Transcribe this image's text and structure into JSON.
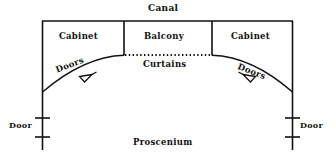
{
  "diagram": {
    "background_color": "#ffffff",
    "line_color": "#111111",
    "labels": {
      "canal": "Canal",
      "cabinet_left": "Cabinet",
      "balcony": "Balcony",
      "cabinet_right": "Cabinet",
      "curtains": "Curtains",
      "doors_left": "Doors",
      "doors_right": "Doors",
      "door_left": "Door",
      "door_right": "Door",
      "proscenium": "Proscenium"
    },
    "icons": {
      "arrow_left": "arrow-wedge-icon",
      "arrow_right": "arrow-wedge-icon",
      "door_swing_left": "door-jamb-icon",
      "door_swing_right": "door-jamb-icon"
    },
    "geometry": {
      "top_wall_y": 21,
      "left_wall_x": 42,
      "right_wall_x": 293,
      "wall_bottom_y": 150,
      "divider_left_x": 124,
      "divider_right_x": 212,
      "divider_bottom_y": 55,
      "curtain_line_y": 55,
      "curtain_style": "dotted",
      "arc_left_end": [
        42,
        92
      ],
      "arc_right_end": [
        293,
        92
      ],
      "arc_apex_y": 55,
      "door_tick_upper_y": 118,
      "door_tick_lower_y": 137
    }
  }
}
